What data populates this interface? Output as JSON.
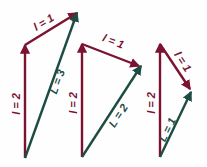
{
  "figure": {
    "background_color": "#fefefe",
    "colors": {
      "component_vector": "#7b1230",
      "resultant_vector": "#1d4c42"
    },
    "diagrams": [
      {
        "name": "diagram-1",
        "vectors": [
          {
            "name": "vertical-component",
            "label": "l = 2",
            "color": "#7b1230",
            "x1": 25,
            "y1": 158,
            "x2": 25,
            "y2": 45
          },
          {
            "name": "slanted-component",
            "label": "l = 1",
            "color": "#7b1230",
            "x1": 25,
            "y1": 45,
            "x2": 77,
            "y2": 13
          },
          {
            "name": "resultant",
            "label": "L = 3",
            "color": "#1d4c42",
            "x1": 25,
            "y1": 158,
            "x2": 77,
            "y2": 13
          }
        ],
        "label_positions": [
          {
            "text": "l = 2",
            "x": 17,
            "y": 104,
            "rotate": -90,
            "cls": "lbl-l"
          },
          {
            "text": "l = 1",
            "x": 44,
            "y": 23,
            "rotate": -31,
            "cls": "lbl-l"
          },
          {
            "text": "L = 3",
            "x": 58,
            "y": 82,
            "rotate": -70,
            "cls": "lbl-L"
          }
        ]
      },
      {
        "name": "diagram-2",
        "vectors": [
          {
            "name": "vertical-component",
            "label": "l = 2",
            "color": "#7b1230",
            "x1": 82,
            "y1": 157,
            "x2": 82,
            "y2": 44
          },
          {
            "name": "slanted-component",
            "label": "l = 1",
            "color": "#7b1230",
            "x1": 82,
            "y1": 44,
            "x2": 139,
            "y2": 66
          },
          {
            "name": "resultant",
            "label": "L = 2",
            "color": "#1d4c42",
            "x1": 82,
            "y1": 157,
            "x2": 141,
            "y2": 66
          }
        ],
        "label_positions": [
          {
            "text": "l = 2",
            "x": 74,
            "y": 103,
            "rotate": -90,
            "cls": "lbl-l"
          },
          {
            "text": "l = 1",
            "x": 113,
            "y": 42,
            "rotate": 21,
            "cls": "lbl-l"
          },
          {
            "text": "L = 2",
            "x": 119,
            "y": 116,
            "rotate": -57,
            "cls": "lbl-L"
          }
        ]
      },
      {
        "name": "diagram-3",
        "vectors": [
          {
            "name": "vertical-component",
            "label": "l = 2",
            "color": "#7b1230",
            "x1": 160,
            "y1": 157,
            "x2": 160,
            "y2": 44
          },
          {
            "name": "slanted-component",
            "label": "l = 1",
            "color": "#7b1230",
            "x1": 160,
            "y1": 44,
            "x2": 190,
            "y2": 89
          },
          {
            "name": "resultant",
            "label": "L = 1",
            "color": "#1d4c42",
            "x1": 160,
            "y1": 157,
            "x2": 191,
            "y2": 92
          }
        ],
        "label_positions": [
          {
            "text": "l = 2",
            "x": 152,
            "y": 103,
            "rotate": -90,
            "cls": "lbl-l"
          },
          {
            "text": "l = 1",
            "x": 182,
            "y": 62,
            "rotate": 57,
            "cls": "lbl-l"
          },
          {
            "text": "L = 1",
            "x": 168,
            "y": 130,
            "rotate": -64,
            "cls": "lbl-L"
          }
        ]
      }
    ]
  }
}
